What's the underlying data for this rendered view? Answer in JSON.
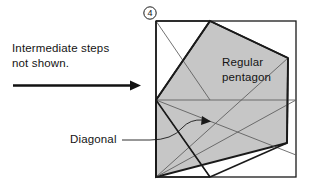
{
  "figure": {
    "step_number": "4",
    "instruction_text": "Intermediate steps\nnot shown.",
    "arrow_icon": "right-arrow-icon",
    "pentagon_label_line1": "Regular",
    "pentagon_label_line2": "pentagon",
    "diagonal_label": "Diagonal",
    "colors": {
      "pentagon_fill": "#c6c6c6",
      "stroke_heavy": "#1a1a1a",
      "stroke_light": "#5a5a5a",
      "background": "#ffffff"
    },
    "geometry": {
      "square": {
        "x": 156,
        "y": 21,
        "width": 140,
        "height": 156
      },
      "pentagon_vertices": "210,21 288,58 287,143 156,177 156,100",
      "fold_lines": [
        "156,21 210,100",
        "210,21 156,100",
        "156,100 296,100",
        "156,177 288,58",
        "210,177 156,100",
        "156,100 210,177"
      ],
      "diagonal_pointer_from": "122,140",
      "diagonal_pointer_to": "207,122"
    }
  }
}
